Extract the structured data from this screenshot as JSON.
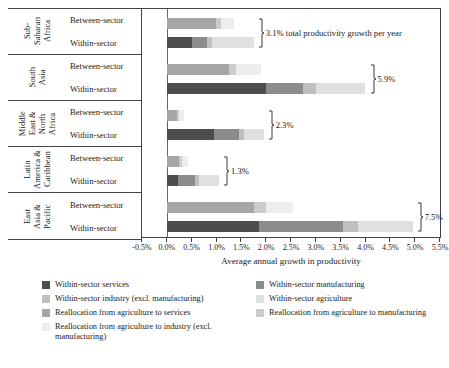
{
  "chart_data": {
    "type": "bar",
    "orientation": "horizontal",
    "stacked": true,
    "title": "",
    "xlabel": "Average annual growth in productivity",
    "ylabel": "",
    "xlim": [
      -0.5,
      5.5
    ],
    "xtick_labels": [
      "-0.5%",
      "0.0%",
      "0.5%",
      "1.0%",
      "1.5%",
      "2.0%",
      "2.5%",
      "3.0%",
      "3.5%",
      "4.0%",
      "4.5%",
      "5.0%",
      "5.5%"
    ],
    "xtick_values": [
      -0.5,
      0.0,
      0.5,
      1.0,
      1.5,
      2.0,
      2.5,
      3.0,
      3.5,
      4.0,
      4.5,
      5.0,
      5.5
    ],
    "grid": false,
    "legend_position": "bottom",
    "categories": [
      "Sub-Saharan Africa",
      "South Asia",
      "Middle East & North Africa",
      "Latin America & Caribbean",
      "East Asia & Pacific"
    ],
    "bar_groups": [
      "Between-sector",
      "Within-sector"
    ],
    "series": [
      {
        "name": "Within-sector services",
        "color": "#4d4d4d",
        "group": "Within-sector"
      },
      {
        "name": "Within-sector manufacturing",
        "color": "#8c8c8c",
        "group": "Within-sector"
      },
      {
        "name": "Within-sector industry (excl. manufacturing)",
        "color": "#bfbfbf",
        "group": "Within-sector"
      },
      {
        "name": "Within-sector agriculture",
        "color": "#e0e0e0",
        "group": "Within-sector"
      },
      {
        "name": "Reallocation from agriculture to services",
        "color": "#a6a6a6",
        "group": "Between-sector"
      },
      {
        "name": "Reallocation from agriculture to manufacturing",
        "color": "#cccccc",
        "group": "Between-sector"
      },
      {
        "name": "Reallocation from agriculture to industry (excl. manufacturing)",
        "color": "#ededed",
        "group": "Between-sector"
      }
    ],
    "regions": [
      {
        "region": "Sub-Saharan Africa",
        "total_label": "3.1% total productivity growth per year",
        "between_sector": [
          {
            "series": "Reallocation from agriculture to services",
            "value": 1.0
          },
          {
            "series": "Reallocation from agriculture to manufacturing",
            "value": 0.1
          },
          {
            "series": "Reallocation from agriculture to industry (excl. manufacturing)",
            "value": 0.25
          }
        ],
        "within_sector": [
          {
            "series": "Within-sector services",
            "value": 0.5
          },
          {
            "series": "Within-sector manufacturing",
            "value": 0.3
          },
          {
            "series": "Within-sector industry (excl. manufacturing)",
            "value": 0.1
          },
          {
            "series": "Within-sector agriculture",
            "value": 0.85
          }
        ]
      },
      {
        "region": "South Asia",
        "total_label": "5.9%",
        "between_sector": [
          {
            "series": "Reallocation from agriculture to services",
            "value": 1.25
          },
          {
            "series": "Reallocation from agriculture to manufacturing",
            "value": 0.15
          },
          {
            "series": "Reallocation from agriculture to industry (excl. manufacturing)",
            "value": 0.5
          }
        ],
        "within_sector": [
          {
            "series": "Within-sector services",
            "value": 2.0
          },
          {
            "series": "Within-sector manufacturing",
            "value": 0.75
          },
          {
            "series": "Within-sector industry (excl. manufacturing)",
            "value": 0.25
          },
          {
            "series": "Within-sector agriculture",
            "value": 1.0
          }
        ]
      },
      {
        "region": "Middle East & North Africa",
        "total_label": "2.3%",
        "between_sector": [
          {
            "series": "Reallocation from agriculture to services",
            "value": 0.2
          },
          {
            "series": "Reallocation from agriculture to manufacturing",
            "value": 0.05
          },
          {
            "series": "Reallocation from agriculture to industry (excl. manufacturing)",
            "value": 0.1
          }
        ],
        "within_sector": [
          {
            "series": "Within-sector services",
            "value": 0.95
          },
          {
            "series": "Within-sector manufacturing",
            "value": 0.5
          },
          {
            "series": "Within-sector industry (excl. manufacturing)",
            "value": 0.1
          },
          {
            "series": "Within-sector agriculture",
            "value": 0.4
          }
        ]
      },
      {
        "region": "Latin America & Caribbean",
        "total_label": "1.3%",
        "between_sector": [
          {
            "series": "Reallocation from agriculture to services",
            "value": 0.25
          },
          {
            "series": "Reallocation from agriculture to manufacturing",
            "value": 0.05
          },
          {
            "series": "Reallocation from agriculture to industry (excl. manufacturing)",
            "value": 0.12
          }
        ],
        "within_sector": [
          {
            "series": "Within-sector services",
            "value": 0.22
          },
          {
            "series": "Within-sector manufacturing",
            "value": 0.35
          },
          {
            "series": "Within-sector industry (excl. manufacturing)",
            "value": 0.08
          },
          {
            "series": "Within-sector agriculture",
            "value": 0.4
          }
        ]
      },
      {
        "region": "East Asia & Pacific",
        "total_label": "7.5%",
        "between_sector": [
          {
            "series": "Reallocation from agriculture to services",
            "value": 1.75
          },
          {
            "series": "Reallocation from agriculture to manufacturing",
            "value": 0.25
          },
          {
            "series": "Reallocation from agriculture to industry (excl. manufacturing)",
            "value": 0.55
          }
        ],
        "within_sector": [
          {
            "series": "Within-sector services",
            "value": 1.85
          },
          {
            "series": "Within-sector manufacturing",
            "value": 1.7
          },
          {
            "series": "Within-sector industry (excl. manufacturing)",
            "value": 0.3
          },
          {
            "series": "Within-sector agriculture",
            "value": 1.1
          }
        ]
      }
    ]
  },
  "row_labels": {
    "sector_between": "Between-sector",
    "sector_within": "Within-sector",
    "regions": [
      "Sub-\nSaharan\nAfrica",
      "South\nAsia",
      "Middle\nEast &\nNorth\nAfrica",
      "Latin\nAmerica &\nCaribbean",
      "East\nAsia &\nPacific"
    ]
  },
  "legend": {
    "left_column": [
      "Within-sector services",
      "Within-sector industry (excl. manufacturing)",
      "Reallocation from agriculture to services",
      "Reallocation from agriculture to industry (excl. manufacturing)"
    ],
    "right_column": [
      "Within-sector manufacturing",
      "Within-sector agriculture",
      "Reallocation from agriculture to manufacturing"
    ],
    "left_colors": [
      "#4d4d4d",
      "#bfbfbf",
      "#a6a6a6",
      "#ededed"
    ],
    "right_colors": [
      "#8c8c8c",
      "#e0e0e0",
      "#cccccc"
    ]
  }
}
